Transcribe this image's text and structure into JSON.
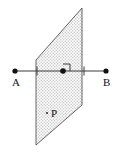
{
  "figure": {
    "type": "geometry-diagram",
    "background_color": "#ffffff",
    "stroke_color": "#3a3a3a",
    "fill_color": "#d9d9d9",
    "label_color": "#111111",
    "plane": {
      "name_label": "P",
      "fill_pattern": "stipple-dots",
      "vertices": [
        {
          "x": 36,
          "y": 60
        },
        {
          "x": 82,
          "y": 8
        },
        {
          "x": 82,
          "y": 105
        },
        {
          "x": 36,
          "y": 145
        }
      ]
    },
    "line": {
      "label_start": "A",
      "label_end": "B",
      "start": {
        "x": 15,
        "y": 71
      },
      "end": {
        "x": 106,
        "y": 71
      },
      "endpoint_marker": "filled-dot",
      "tick_marks": [
        {
          "x": 37,
          "y": 71
        },
        {
          "x": 84,
          "y": 71
        }
      ]
    },
    "intersection_point": {
      "x": 63,
      "y": 71,
      "marker": "filled-dot"
    },
    "right_angle_marker": {
      "x": 63,
      "y": 71,
      "size": 7
    },
    "plane_label_dot": {
      "x": 47,
      "y": 113
    },
    "labels": {
      "a": {
        "text": "A",
        "x": 12,
        "y": 86
      },
      "b": {
        "text": "B",
        "x": 103,
        "y": 86
      },
      "p": {
        "text": "P",
        "x": 51,
        "y": 117
      }
    }
  }
}
